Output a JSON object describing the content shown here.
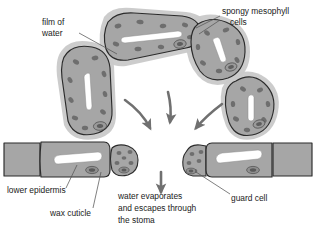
{
  "diagram": {
    "background_color": "#ffffff",
    "colors": {
      "cell_fill": "#a6a6a6",
      "cell_halo": "#c9c9c9",
      "cell_outline": "#2b2b2b",
      "chloroplast": "#6e6e6e",
      "nucleus_fill": "#6a6a6a",
      "nucleus_ring": "#9a9a9a",
      "water_film": "#ffffff",
      "arrow": "#707070",
      "leader_line": "#555555",
      "text": "#1a1a1a"
    }
  },
  "labels": {
    "film_of_water": {
      "line1": "film of",
      "line2": "water",
      "x": 42,
      "y": 22
    },
    "spongy_mesophyll": {
      "line1": "spongy mesophyll",
      "line2": "cells",
      "x": 222,
      "y": 14
    },
    "lower_epidermis": {
      "text": "lower epidermis",
      "x": 8,
      "y": 194
    },
    "wax_cuticle": {
      "text": "wax cuticle",
      "x": 50,
      "y": 216
    },
    "guard_cell": {
      "text": "guard cell",
      "x": 232,
      "y": 200
    },
    "water_escapes": {
      "line1": "water evaporates",
      "line2": "and escapes through",
      "line3": "the stoma",
      "x": 118,
      "y": 196
    }
  },
  "structures": {
    "mesophyll_cells": [
      {
        "id": "cell-top-center",
        "name": "spongy mesophyll cell top centre"
      },
      {
        "id": "cell-left",
        "name": "spongy mesophyll cell left"
      },
      {
        "id": "cell-right-upper",
        "name": "spongy mesophyll cell right upper"
      },
      {
        "id": "cell-right-lower",
        "name": "spongy mesophyll cell right lower"
      }
    ],
    "epidermis_cells": [
      {
        "id": "epidermis-far-left",
        "name": "lower epidermis cell far left"
      },
      {
        "id": "guard-cell-left",
        "name": "left guard cell"
      },
      {
        "id": "epidermis-small-left",
        "name": "small epidermal cell left of stoma"
      },
      {
        "id": "epidermis-small-right",
        "name": "small epidermal cell right of stoma"
      },
      {
        "id": "guard-cell-right",
        "name": "right guard cell"
      },
      {
        "id": "epidermis-far-right",
        "name": "lower epidermis cell far right"
      }
    ],
    "arrows": [
      {
        "id": "arrow-left",
        "name": "water vapour arrow from left cell",
        "direction": "down-right"
      },
      {
        "id": "arrow-center",
        "name": "water vapour arrow from top cell",
        "direction": "down"
      },
      {
        "id": "arrow-right",
        "name": "water vapour arrow from right cell",
        "direction": "down-left"
      },
      {
        "id": "arrow-stoma",
        "name": "water vapour arrow exiting stoma",
        "direction": "down"
      }
    ]
  }
}
